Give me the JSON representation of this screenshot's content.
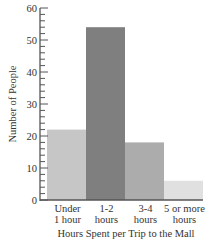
{
  "chart_data": {
    "type": "bar",
    "title": "",
    "xlabel": "Hours Spent per Trip to the Mall",
    "ylabel": "Number of People",
    "categories": [
      [
        "Under",
        "1 hour"
      ],
      [
        "1-2",
        "hours"
      ],
      [
        "3-4",
        "hours"
      ],
      [
        "5 or more",
        "hours"
      ]
    ],
    "values": [
      22,
      54,
      18,
      6
    ],
    "bar_colors": [
      "#c6c6c6",
      "#7f7f7f",
      "#acacac",
      "#e0e0e0"
    ],
    "ylim": [
      0,
      60
    ],
    "major_ticks": [
      0,
      10,
      20,
      30,
      40,
      50,
      60
    ],
    "minor_tick_step": 2,
    "grid": false,
    "legend": null
  }
}
